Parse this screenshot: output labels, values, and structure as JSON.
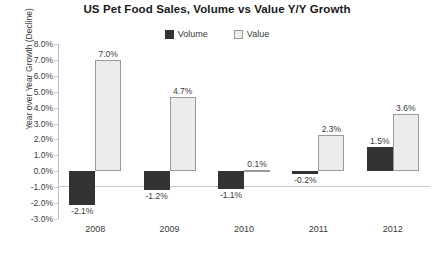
{
  "chart_data": {
    "type": "bar",
    "title": "US Pet Food Sales, Volume vs Value Y/Y Growth",
    "xlabel": "",
    "ylabel": "Year over Year Growth (Decline)",
    "categories": [
      "2008",
      "2009",
      "2010",
      "2011",
      "2012"
    ],
    "series": [
      {
        "name": "Volume",
        "color": "#333333",
        "values": [
          -2.1,
          -1.2,
          -1.1,
          -0.2,
          1.5
        ],
        "labels": [
          "-2.1%",
          "-1.2%",
          "-1.1%",
          "-0.2%",
          "1.5%"
        ]
      },
      {
        "name": "Value",
        "color": "#ececec",
        "values": [
          7.0,
          4.7,
          0.1,
          2.3,
          3.6
        ],
        "labels": [
          "7.0%",
          "4.7%",
          "0.1%",
          "2.3%",
          "3.6%"
        ]
      }
    ],
    "ylim": [
      -3.0,
      8.0
    ],
    "ytick_step": 1.0,
    "ytick_labels": [
      "8.0%",
      "7.0%",
      "6.0%",
      "5.0%",
      "4.0%",
      "3.0%",
      "2.0%",
      "1.0%",
      "0.0%",
      "-1.0%",
      "-2.0%",
      "-3.0%"
    ],
    "ytick_values": [
      8.0,
      7.0,
      6.0,
      5.0,
      4.0,
      3.0,
      2.0,
      1.0,
      0.0,
      -1.0,
      -2.0,
      -3.0
    ],
    "grid": false,
    "legend_position": "top-center",
    "value_unit": "%"
  }
}
